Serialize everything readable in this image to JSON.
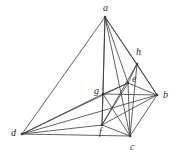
{
  "figure": {
    "background_color": "#ffffff",
    "stroke_color": "#3a3a3a",
    "label_color": "#2b2b2b",
    "width": 179,
    "height": 157
  },
  "vertices": [
    {
      "id": "a",
      "label": "a",
      "x": 105,
      "y": 17,
      "label_x": 103,
      "label_y": 3,
      "role": "apex"
    },
    {
      "id": "b",
      "label": "b",
      "x": 157,
      "y": 95,
      "label_x": 163,
      "label_y": 90,
      "role": "right"
    },
    {
      "id": "c",
      "label": "c",
      "x": 130,
      "y": 136,
      "label_x": 130,
      "label_y": 142,
      "role": "bottom"
    },
    {
      "id": "d",
      "label": "d",
      "x": 22,
      "y": 134,
      "label_x": 11,
      "label_y": 128,
      "role": "left"
    },
    {
      "id": "e",
      "label": "e",
      "x": 128,
      "y": 83,
      "label_x": 132,
      "label_y": 74,
      "role": "interior-upper"
    },
    {
      "id": "f",
      "label": "f",
      "x": 102,
      "y": 125,
      "label_x": 99,
      "label_y": 127,
      "role": "interior-lower"
    },
    {
      "id": "g",
      "label": "g",
      "x": 103,
      "y": 94,
      "label_x": 94,
      "label_y": 86,
      "role": "interior-mid"
    },
    {
      "id": "h",
      "label": "h",
      "x": 137,
      "y": 64,
      "label_x": 136,
      "label_y": 47,
      "role": "upper-right"
    }
  ],
  "edges": [
    {
      "from": "a",
      "to": "d"
    },
    {
      "from": "a",
      "to": "b"
    },
    {
      "from": "a",
      "to": "c"
    },
    {
      "from": "a",
      "to": "e"
    },
    {
      "from": "a",
      "to": "f"
    },
    {
      "from": "a",
      "to": "h"
    },
    {
      "from": "a",
      "to": "g"
    },
    {
      "from": "d",
      "to": "b"
    },
    {
      "from": "d",
      "to": "c"
    },
    {
      "from": "d",
      "to": "e"
    },
    {
      "from": "d",
      "to": "f"
    },
    {
      "from": "d",
      "to": "g"
    },
    {
      "from": "b",
      "to": "c"
    },
    {
      "from": "b",
      "to": "e"
    },
    {
      "from": "b",
      "to": "f"
    },
    {
      "from": "b",
      "to": "g"
    },
    {
      "from": "c",
      "to": "e"
    },
    {
      "from": "c",
      "to": "f"
    },
    {
      "from": "c",
      "to": "h"
    },
    {
      "from": "e",
      "to": "f"
    },
    {
      "from": "e",
      "to": "g"
    },
    {
      "from": "e",
      "to": "h"
    },
    {
      "from": "f",
      "to": "g"
    },
    {
      "from": "f",
      "to": "h"
    },
    {
      "from": "g",
      "to": "c"
    },
    {
      "from": "h",
      "to": "b"
    }
  ]
}
